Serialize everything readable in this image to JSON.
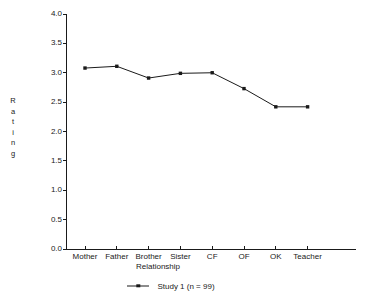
{
  "chart_data": {
    "type": "line",
    "title": "",
    "subtitle": "",
    "xlabel": "Relationship",
    "ylabel": "Rating",
    "categories": [
      "Mother",
      "Father",
      "Brother",
      "Sister",
      "CF",
      "OF",
      "OK",
      "Teacher"
    ],
    "series": [
      {
        "name": "Study 1 (n = 99)",
        "values": [
          3.08,
          3.11,
          2.91,
          2.99,
          3.0,
          2.73,
          2.42,
          2.42
        ],
        "marker": "square",
        "color": "#1a1a1a"
      }
    ],
    "ylim": [
      0.0,
      4.0
    ],
    "ytick_labels": [
      "0.0",
      "0.5",
      "1.0",
      "1.5",
      "2.0",
      "2.5",
      "3.0",
      "3.5",
      "4.0"
    ],
    "ytick_values": [
      0.0,
      0.5,
      1.0,
      1.5,
      2.0,
      2.5,
      3.0,
      3.5,
      4.0
    ],
    "grid": false,
    "legend_position": "bottom",
    "legend_entries": [
      "Study 1 (n = 99)"
    ],
    "background_color": "#ffffff",
    "axis_color": "#1a1a1a"
  },
  "axis": {
    "ylabel_letters": [
      "R",
      "a",
      "t",
      "i",
      "n",
      "g"
    ]
  },
  "legend": {
    "entry_label": "Study 1 (n = 99)"
  }
}
